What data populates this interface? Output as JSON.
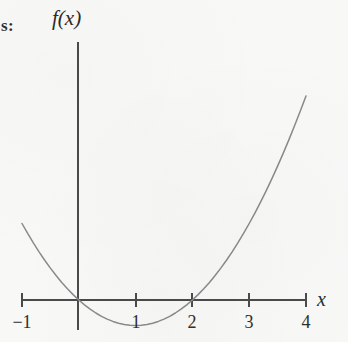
{
  "page": {
    "background_color": "#f8f8f7",
    "ink_color": "#3a3a3a",
    "curve_color": "#8a8a8a",
    "axis_color": "#4a4a4a",
    "crop_fragment_text": "s:"
  },
  "figure": {
    "name": "parabola-graph",
    "y_axis_label": "f(x)",
    "x_axis_label": "x"
  },
  "chart_data": {
    "type": "line",
    "title": "",
    "subtitle": "",
    "xlabel": "x",
    "ylabel": "f(x)",
    "xlim": [
      -1.15,
      4.15
    ],
    "ylim": [
      -1.25,
      4.9
    ],
    "grid": false,
    "legend": null,
    "x_ticks": [
      -1,
      1,
      2,
      3,
      4
    ],
    "x_tick_labels": [
      "−1",
      "1",
      "2",
      "3",
      "4"
    ],
    "y_ticks": [],
    "y_tick_labels": [],
    "axes": {
      "x_axis_drawn_from": -1,
      "x_axis_drawn_to": 4,
      "y_axis_drawn_from": -1.25,
      "y_axis_drawn_to": 4.6,
      "origin_shown": true
    },
    "annotations": [],
    "series": [
      {
        "name": "f(x) = x^2 - 2x",
        "equation": "x^2 - 2x",
        "roots": [
          0,
          2
        ],
        "vertex": [
          1,
          -1
        ],
        "color": "#8a8a8a",
        "x": [
          -1.0,
          -0.9,
          -0.8,
          -0.7,
          -0.6,
          -0.5,
          -0.4,
          -0.3,
          -0.2,
          -0.1,
          0.0,
          0.1,
          0.2,
          0.3,
          0.4,
          0.5,
          0.6,
          0.7,
          0.8,
          0.9,
          1.0,
          1.1,
          1.2,
          1.3,
          1.4,
          1.5,
          1.6,
          1.7,
          1.8,
          1.9,
          2.0,
          2.1,
          2.2,
          2.3,
          2.4,
          2.5,
          2.6,
          2.7,
          2.8,
          2.9,
          3.0,
          3.1,
          3.2,
          3.3,
          3.4,
          3.5,
          3.6,
          3.7,
          3.8,
          3.9,
          4.0
        ],
        "values": [
          3.0,
          2.61,
          2.24,
          1.89,
          1.56,
          1.25,
          0.96,
          0.69,
          0.44,
          0.21,
          0.0,
          -0.19,
          -0.36,
          -0.51,
          -0.64,
          -0.75,
          -0.84,
          -0.91,
          -0.96,
          -0.99,
          -1.0,
          -0.99,
          -0.96,
          -0.91,
          -0.84,
          -0.75,
          -0.64,
          -0.51,
          -0.36,
          -0.19,
          0.0,
          0.21,
          0.44,
          0.69,
          0.96,
          1.25,
          1.56,
          1.89,
          2.24,
          2.61,
          3.0,
          3.41,
          3.84,
          4.29,
          4.76,
          5.25,
          5.76,
          6.29,
          6.84,
          7.41,
          8.0
        ]
      }
    ]
  }
}
